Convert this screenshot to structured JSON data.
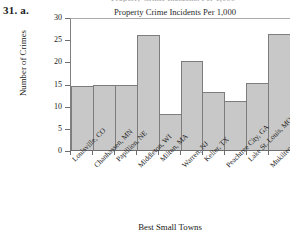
{
  "problem_number": "31. a.",
  "clipped_title_sliver": "Property Crime Incidents Per 1,000",
  "chart_data": {
    "type": "bar",
    "title": "Property Crime Incidents Per 1,000",
    "xlabel": "Best Small Towns",
    "ylabel": "Number of Crimes",
    "ylim": [
      0,
      30
    ],
    "ytick_labels": [
      "0",
      "5",
      "10",
      "15",
      "20",
      "25",
      "30"
    ],
    "ytick_values": [
      0,
      5,
      10,
      15,
      20,
      25,
      30
    ],
    "grid": false,
    "legend": null,
    "bar_fill_color": "#c8c8c8",
    "bar_edge_color": "#7d7d7d",
    "categories": [
      "Louisville, CO",
      "Chanhassen, MN",
      "Papillion, NE",
      "Middleton, WI",
      "Milton, MA",
      "Warren, NJ",
      "Keller, TX",
      "Peachtree City, GA",
      "Lake St. Louis, MO",
      "Mukilteo, WA"
    ],
    "values": [
      14.7,
      15.0,
      15.0,
      26.3,
      8.4,
      20.4,
      13.3,
      11.4,
      15.4,
      26.6
    ]
  }
}
